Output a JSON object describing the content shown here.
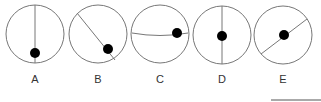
{
  "figure": {
    "stroke_color": "#777777",
    "dot_color": "#000000",
    "options": [
      {
        "label": "A",
        "cx": 35,
        "cy": 34,
        "r": 29,
        "line": "M35,5 L35,63",
        "dot": [
          35,
          53
        ]
      },
      {
        "label": "B",
        "cx": 98,
        "cy": 34,
        "r": 29,
        "line": "M77,13 L115,60",
        "dot": [
          108,
          49
        ]
      },
      {
        "label": "C",
        "cx": 160,
        "cy": 34,
        "r": 29,
        "line": "M132,33 Q160,38 188,33",
        "dot": [
          177,
          33
        ]
      },
      {
        "label": "D",
        "cx": 222,
        "cy": 35,
        "r": 29,
        "line": "M222,6 L222,64",
        "dot": [
          222,
          36
        ]
      },
      {
        "label": "E",
        "cx": 283,
        "cy": 35,
        "r": 29,
        "line": "M261,54 L307,19",
        "dot": [
          284,
          35
        ]
      }
    ]
  },
  "answer_box_line": {
    "x1": 271,
    "x2": 321,
    "y": 100
  }
}
